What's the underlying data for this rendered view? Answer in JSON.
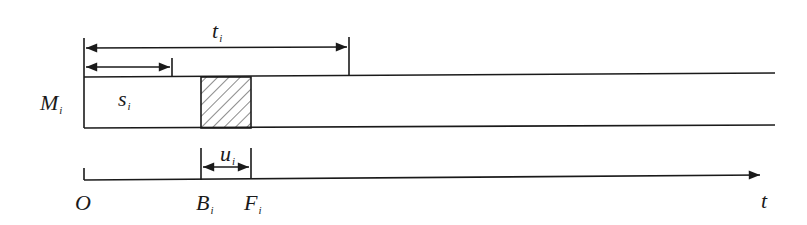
{
  "diagram": {
    "machine_label": {
      "main": "M",
      "sub": "i"
    },
    "processing_label": {
      "main": "s",
      "sub": "i"
    },
    "total_label": {
      "main": "t",
      "sub": "i"
    },
    "unavailable_label": {
      "main": "u",
      "sub": "i"
    },
    "origin_label": {
      "main": "O",
      "sub": ""
    },
    "begin_label": {
      "main": "B",
      "sub": "i"
    },
    "finish_label": {
      "main": "F",
      "sub": "i"
    },
    "axis_label": {
      "main": "t",
      "sub": ""
    },
    "colors": {
      "stroke": "#1a1a1a",
      "background": "#ffffff"
    }
  }
}
